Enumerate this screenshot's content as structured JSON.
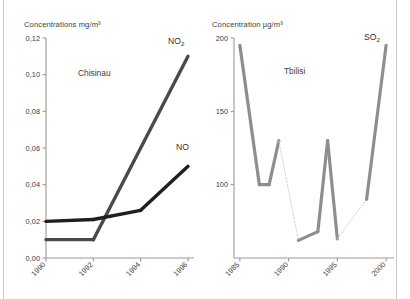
{
  "chart_data": [
    {
      "id": "chisinau",
      "type": "line",
      "title": "Concentrations mg/m³",
      "annotation": "Chisinau",
      "xlabel": "",
      "ylabel": "Concentrations mg/m³",
      "xlim": [
        1990,
        1996
      ],
      "ylim": [
        0.0,
        0.12
      ],
      "xticks": [
        "1990",
        "1992",
        "1994",
        "1996"
      ],
      "xtick_values": [
        1990,
        1992,
        1994,
        1996
      ],
      "yticks": [
        "0,00",
        "0,02",
        "0,04",
        "0,06",
        "0,08",
        "0,10",
        "0,12"
      ],
      "ytick_values": [
        0.0,
        0.02,
        0.04,
        0.06,
        0.08,
        0.1,
        0.12
      ],
      "grid": false,
      "legend": "inline-labels",
      "series": [
        {
          "name": "NO₂",
          "label_text": "NO",
          "label_sub": "2",
          "color": "#4a4a4a",
          "x": [
            1990,
            1992,
            1996
          ],
          "values": [
            0.01,
            0.01,
            0.11
          ]
        },
        {
          "name": "NO",
          "label_text": "NO",
          "label_sub": "",
          "color": "#1f1f1f",
          "x": [
            1990,
            1992,
            1994,
            1996
          ],
          "values": [
            0.02,
            0.021,
            0.026,
            0.05
          ]
        }
      ]
    },
    {
      "id": "tbilisi",
      "type": "line",
      "title": "Concentration µg/m³",
      "annotation": "Tbilisi",
      "xlabel": "",
      "ylabel": "Concentration µg/m³",
      "xlim": [
        1984.4,
        2000.4
      ],
      "ylim": [
        50,
        200
      ],
      "xticks": [
        "1985",
        "1990",
        "1995",
        "2000"
      ],
      "xtick_values": [
        1985,
        1990,
        1995,
        2000
      ],
      "yticks": [
        "100",
        "150",
        "200"
      ],
      "ytick_values": [
        100,
        150,
        200
      ],
      "grid": false,
      "legend": "inline-labels",
      "series": [
        {
          "name": "SO₂",
          "label_text": "SO",
          "label_sub": "2",
          "color": "#8e8e8e",
          "gap_color": "#d3d3d3",
          "x": [
            1985,
            1987,
            1988,
            1989,
            1991,
            1993,
            1994,
            1995,
            1998,
            2000
          ],
          "values": [
            195,
            100,
            100,
            130,
            62,
            68,
            130,
            63,
            90,
            195
          ],
          "gap_segments": [
            {
              "from_index": 3,
              "to_index": 4
            },
            {
              "from_index": 7,
              "to_index": 8
            }
          ]
        }
      ]
    }
  ]
}
